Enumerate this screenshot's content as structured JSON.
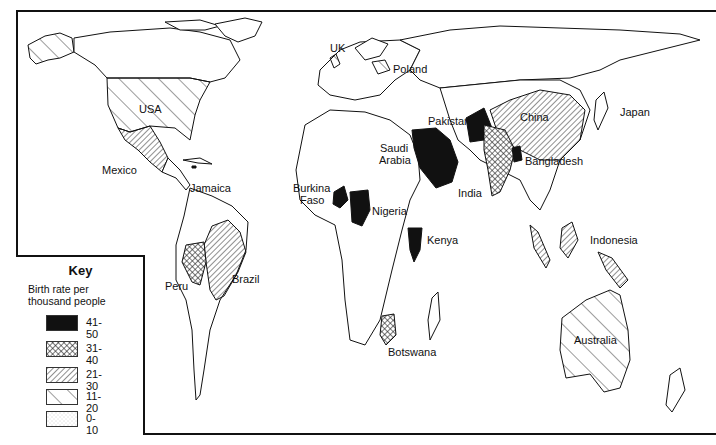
{
  "key": {
    "title": "Key",
    "subtitle_line1": "Birth rate per",
    "subtitle_line2": "thousand people",
    "classes": [
      {
        "range": "41-50",
        "pattern": "solid-black"
      },
      {
        "range": "31-40",
        "pattern": "crosshatch"
      },
      {
        "range": "21-30",
        "pattern": "dense-diagonal"
      },
      {
        "range": "11-20",
        "pattern": "sparse-diagonal"
      },
      {
        "range": "0-10",
        "pattern": "stipple"
      }
    ]
  },
  "countries": [
    {
      "name": "USA",
      "class": "11-20"
    },
    {
      "name": "Mexico",
      "class": "21-30"
    },
    {
      "name": "Jamaica",
      "class": "41-50"
    },
    {
      "name": "Peru",
      "class": "31-40"
    },
    {
      "name": "Brazil",
      "class": "21-30"
    },
    {
      "name": "UK",
      "class": "11-20"
    },
    {
      "name": "Poland",
      "class": "11-20"
    },
    {
      "name": "Burkina Faso",
      "class": "41-50"
    },
    {
      "name": "Nigeria",
      "class": "41-50"
    },
    {
      "name": "Saudi Arabia",
      "class": "41-50"
    },
    {
      "name": "Kenya",
      "class": "41-50"
    },
    {
      "name": "Botswana",
      "class": "31-40"
    },
    {
      "name": "Pakistan",
      "class": "41-50"
    },
    {
      "name": "India",
      "class": "31-40"
    },
    {
      "name": "Bangladesh",
      "class": "41-50"
    },
    {
      "name": "China",
      "class": "21-30"
    },
    {
      "name": "Japan",
      "class": "11-20"
    },
    {
      "name": "Indonesia",
      "class": "21-30"
    },
    {
      "name": "Australia",
      "class": "11-20"
    }
  ],
  "labels": {
    "usa": "USA",
    "mexico": "Mexico",
    "jamaica": "Jamaica",
    "peru": "Peru",
    "brazil": "Brazil",
    "uk": "UK",
    "poland": "Poland",
    "burkina1": "Burkina",
    "burkina2": "Faso",
    "nigeria": "Nigeria",
    "saudi1": "Saudi",
    "saudi2": "Arabia",
    "kenya": "Kenya",
    "botswana": "Botswana",
    "pakistan": "Pakistan",
    "india": "India",
    "bangladesh": "Bangladesh",
    "china": "China",
    "japan": "Japan",
    "indonesia": "Indonesia",
    "australia": "Australia"
  }
}
